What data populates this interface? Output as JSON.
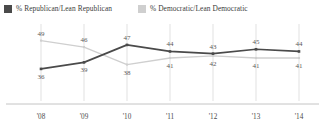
{
  "legend": {
    "position": "top-left",
    "items": [
      {
        "key": "republican",
        "label": "% Republican/Lean Republican",
        "color": "#4a4a4a",
        "swatch": "legend-swatch-square"
      },
      {
        "key": "democratic",
        "label": "% Democratic/Lean Democratic",
        "color": "#cfcfcf",
        "swatch": "legend-swatch-square"
      }
    ]
  },
  "chart_data": {
    "type": "line",
    "title": "",
    "subtitle": "",
    "xlabel": "",
    "ylabel": "",
    "categories": [
      "'08",
      "'09",
      "'10",
      "'11",
      "'12",
      "'13",
      "'14"
    ],
    "ylim": [
      30,
      52
    ],
    "grid": {
      "vertical": true,
      "horizontal": false
    },
    "legend_position": "top-left",
    "axis": {
      "baseline": true,
      "baseline_color": "#bdbdbd"
    },
    "series": [
      {
        "name": "% Republican/Lean Republican",
        "key": "republican",
        "color": "#4a4a4a",
        "marker": "square",
        "values": [
          36,
          39,
          47,
          44,
          43,
          45,
          44
        ],
        "label_positions": [
          "below",
          "below",
          "above",
          "above",
          "above",
          "above",
          "above"
        ]
      },
      {
        "name": "% Democratic/Lean Democratic",
        "key": "democratic",
        "color": "#cfcfcf",
        "marker": "square",
        "values": [
          49,
          46,
          38,
          41,
          42,
          41,
          41
        ],
        "label_positions": [
          "above",
          "above",
          "below",
          "below",
          "below",
          "below",
          "below"
        ]
      }
    ]
  }
}
